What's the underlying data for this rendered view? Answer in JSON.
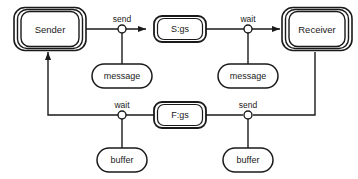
{
  "diagram": {
    "colors": {
      "stroke": "#1a1a1a",
      "fill": "#ffffff",
      "background": "#ffffff",
      "text": "#1a1a1a"
    },
    "processes": [
      {
        "id": "sender",
        "label": "Sender",
        "x": 48,
        "y": 28
      },
      {
        "id": "receiver",
        "label": "Receiver",
        "x": 315,
        "y": 28
      }
    ],
    "states": [
      {
        "id": "sigs",
        "label": "S:gs",
        "x": 180,
        "y": 28
      },
      {
        "id": "figs",
        "label": "F:gs",
        "x": 180,
        "y": 114
      }
    ],
    "resources": [
      {
        "id": "message-top-left",
        "label": "message",
        "x": 122,
        "y": 76
      },
      {
        "id": "message-top-right",
        "label": "message",
        "x": 248,
        "y": 76
      },
      {
        "id": "buffer-bottom-left",
        "label": "buffer",
        "x": 122,
        "y": 160
      },
      {
        "id": "buffer-bottom-right",
        "label": "buffer",
        "x": 248,
        "y": 160
      }
    ],
    "edge_labels": [
      {
        "id": "send-top",
        "label": "send",
        "x": 122,
        "y": 19
      },
      {
        "id": "wait-top",
        "label": "wait",
        "x": 248,
        "y": 19
      },
      {
        "id": "wait-bottom",
        "label": "wait",
        "x": 122,
        "y": 105
      },
      {
        "id": "send-bottom",
        "label": "send",
        "x": 248,
        "y": 105
      }
    ],
    "junctions": [
      {
        "id": "junction-send-top",
        "x": 122,
        "y": 29
      },
      {
        "id": "junction-wait-top",
        "x": 248,
        "y": 29
      },
      {
        "id": "junction-wait-bottom",
        "x": 122,
        "y": 115
      },
      {
        "id": "junction-send-bottom",
        "x": 248,
        "y": 115
      }
    ]
  }
}
